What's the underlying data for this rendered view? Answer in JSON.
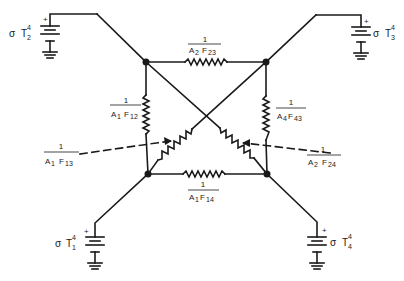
{
  "diagram": {
    "type": "radiation network (electrical analogy)",
    "colors": {
      "stroke": "#1a1a1a",
      "background": "#ffffff"
    },
    "sources": [
      {
        "id": "T2",
        "symbol": "σ",
        "var": "T",
        "sub": "2",
        "sup": "4",
        "polarity": "+"
      },
      {
        "id": "T3",
        "symbol": "σ",
        "var": "T",
        "sub": "3",
        "sup": "4",
        "polarity": "+"
      },
      {
        "id": "T1",
        "symbol": "σ",
        "var": "T",
        "sub": "1",
        "sup": "4",
        "polarity": "+"
      },
      {
        "id": "T4",
        "symbol": "σ",
        "var": "T",
        "sub": "4",
        "sup": "4",
        "polarity": "+"
      }
    ],
    "resistors": [
      {
        "id": "R23",
        "num": "1",
        "den": "A₂ F₂₃",
        "den_main": "A",
        "den_a_sub": "2",
        "den_f": "F",
        "den_f_sub": "23",
        "position": "top"
      },
      {
        "id": "R12",
        "num": "1",
        "den": "A₁ F₁₂",
        "den_main": "A",
        "den_a_sub": "1",
        "den_f": "F",
        "den_f_sub": "12",
        "position": "left"
      },
      {
        "id": "R43",
        "num": "1",
        "den": "A₄ F₄₃",
        "den_main": "A",
        "den_a_sub": "4",
        "den_f": "F",
        "den_f_sub": "43",
        "position": "right"
      },
      {
        "id": "R13",
        "num": "1",
        "den": "A₁ F₁₃",
        "den_main": "A",
        "den_a_sub": "1",
        "den_f": "F",
        "den_f_sub": "13",
        "position": "diagonal-left"
      },
      {
        "id": "R24",
        "num": "1",
        "den": "A₂ F₂₄",
        "den_main": "A",
        "den_a_sub": "2",
        "den_f": "F",
        "den_f_sub": "24",
        "position": "diagonal-right"
      },
      {
        "id": "R14",
        "num": "1",
        "den": "A₁ F₁₄",
        "den_main": "A",
        "den_a_sub": "1",
        "den_f": "F",
        "den_f_sub": "14",
        "position": "bottom"
      }
    ],
    "nodes": [
      "top-left",
      "top-right",
      "bottom-left",
      "bottom-right"
    ]
  }
}
